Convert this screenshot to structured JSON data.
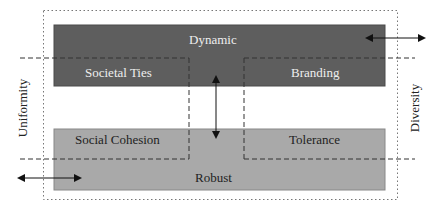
{
  "diagram": {
    "top_box": {
      "label": "Dynamic",
      "color": "#5e5e5e"
    },
    "bottom_box": {
      "label": "Robust",
      "color": "#a9a9a9"
    },
    "quadrants": {
      "top_left": "Societal Ties",
      "top_right": "Branding",
      "bottom_left": "Social Cohesion",
      "bottom_right": "Tolerance"
    },
    "axis_left": "Uniformity",
    "axis_right": "Diversity"
  }
}
